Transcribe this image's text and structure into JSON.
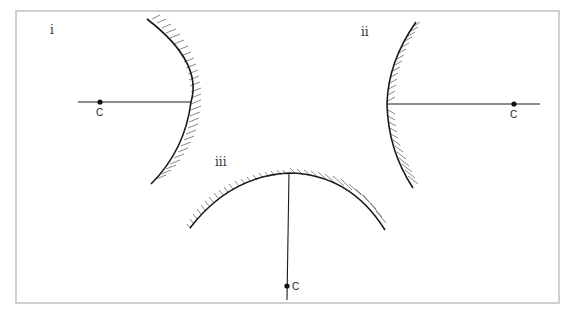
{
  "figure": {
    "panels": [
      {
        "id": "i",
        "label": "i",
        "mirror_type": "convex",
        "reflecting_side": "left",
        "centre_label": "C"
      },
      {
        "id": "ii",
        "label": "ii",
        "mirror_type": "concave",
        "reflecting_side": "left",
        "centre_label": "C"
      },
      {
        "id": "iii",
        "label": "iii",
        "mirror_type": "concave",
        "reflecting_side": "bottom",
        "centre_label": "C"
      }
    ]
  },
  "colors": {
    "line": "#1a1a1a",
    "hatch": "#555555",
    "frame": "#cfcfcf",
    "background": "#ffffff"
  }
}
